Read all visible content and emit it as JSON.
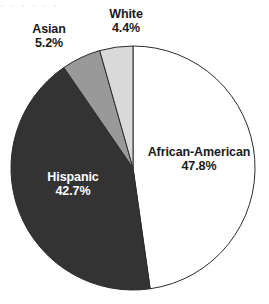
{
  "chart_data": {
    "type": "pie",
    "title": "",
    "subtitle": "",
    "xlabel": "",
    "ylabel": "",
    "legend_position": "none",
    "grid": false,
    "start_angle_deg": 0,
    "direction": "clockwise",
    "categories": [
      "African-American",
      "Hispanic",
      "Asian",
      "White"
    ],
    "values": [
      47.8,
      42.7,
      5.2,
      4.4
    ],
    "value_suffix": "%",
    "slices": [
      {
        "label": "African-American",
        "value": 47.8,
        "value_text": "47.8%",
        "color": "#ffffff",
        "label_placement": "inside",
        "label_color": "#1a1a1a"
      },
      {
        "label": "Hispanic",
        "value": 42.7,
        "value_text": "42.7%",
        "color": "#333333",
        "label_placement": "inside",
        "label_color": "#ffffff"
      },
      {
        "label": "Asian",
        "value": 5.2,
        "value_text": "5.2%",
        "color": "#999999",
        "label_placement": "outside",
        "label_color": "#1a1a1a"
      },
      {
        "label": "White",
        "value": 4.4,
        "value_text": "4.4%",
        "color": "#d9d9d9",
        "label_placement": "outside",
        "label_color": "#1a1a1a"
      }
    ],
    "colors": {
      "african_american": "#ffffff",
      "hispanic": "#333333",
      "asian": "#999999",
      "white": "#d9d9d9",
      "outline": "#2b2b2b",
      "background": "#ffffff",
      "text": "#1a1a1a",
      "text_on_dark": "#ffffff"
    },
    "geometry": {
      "center_x": 133,
      "center_y": 168,
      "radius": 122
    }
  },
  "labels": {
    "african_american": {
      "name": "African-American",
      "value": "47.8%"
    },
    "hispanic": {
      "name": "Hispanic",
      "value": "42.7%"
    },
    "asian": {
      "name": "Asian",
      "value": "5.2%"
    },
    "white": {
      "name": "White",
      "value": "4.4%"
    }
  },
  "artifact": {
    "top_clipped_text": "· · · · · ·"
  }
}
